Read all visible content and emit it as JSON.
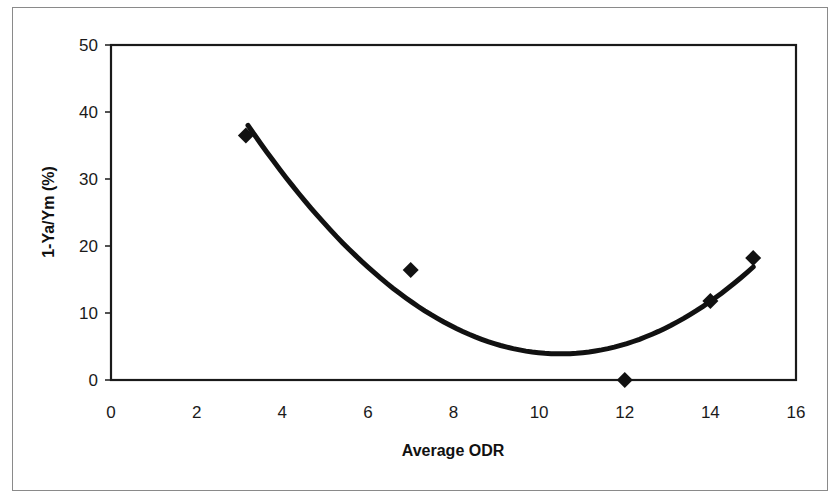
{
  "chart_data": {
    "type": "scatter",
    "title": "",
    "xlabel": "Average ODR",
    "ylabel": "1-Ya/Ym (%)",
    "xlim": [
      0,
      16
    ],
    "ylim": [
      0,
      50
    ],
    "x_ticks": [
      0,
      2,
      4,
      6,
      8,
      10,
      12,
      14,
      16
    ],
    "y_ticks": [
      0,
      10,
      20,
      30,
      40,
      50
    ],
    "grid": false,
    "legend": null,
    "series": [
      {
        "name": "Observed",
        "marker": "diamond",
        "color": "#111111",
        "points": [
          {
            "x": 3.15,
            "y": 36.5
          },
          {
            "x": 7.0,
            "y": 16.4
          },
          {
            "x": 12.0,
            "y": 0.0
          },
          {
            "x": 14.0,
            "y": 11.8
          },
          {
            "x": 15.0,
            "y": 18.2
          }
        ]
      },
      {
        "name": "Polynomial trendline (order 2)",
        "type": "line",
        "color": "#111111",
        "equation_approx": "y = 0.64*(x-10.5)^2 + 3.9",
        "x_range": [
          3.2,
          15.0
        ],
        "points": [
          {
            "x": 3.2,
            "y": 38.0
          },
          {
            "x": 5.0,
            "y": 23.3
          },
          {
            "x": 7.0,
            "y": 11.7
          },
          {
            "x": 9.0,
            "y": 5.3
          },
          {
            "x": 10.5,
            "y": 3.9
          },
          {
            "x": 12.0,
            "y": 5.3
          },
          {
            "x": 14.0,
            "y": 11.7
          },
          {
            "x": 15.0,
            "y": 16.9
          }
        ]
      }
    ]
  },
  "axes": {
    "x_title": "Average ODR",
    "y_title": "1-Ya/Ym (%)",
    "x_tick_labels": [
      "0",
      "2",
      "4",
      "6",
      "8",
      "10",
      "12",
      "14",
      "16"
    ],
    "y_tick_labels": [
      "0",
      "10",
      "20",
      "30",
      "40",
      "50"
    ]
  }
}
